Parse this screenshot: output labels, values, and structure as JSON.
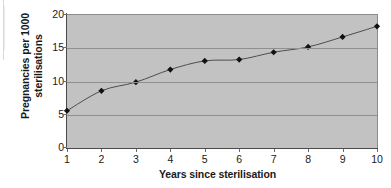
{
  "chart_data": {
    "type": "line",
    "title": "",
    "xlabel": "Years since sterilisation",
    "ylabel": "Pregnancies per 1000 sterilisations",
    "ylabel_lines": [
      "Pregnancies per 1000",
      "sterilisations"
    ],
    "x": [
      1,
      2,
      3,
      4,
      5,
      6,
      7,
      8,
      9,
      10
    ],
    "categories": [
      "1",
      "2",
      "3",
      "4",
      "5",
      "6",
      "7",
      "8",
      "9",
      "10"
    ],
    "values": [
      5.6,
      8.6,
      9.9,
      11.8,
      13.1,
      13.3,
      14.4,
      15.2,
      16.7,
      18.3
    ],
    "series": [
      {
        "name": "Cumulative pregnancy rate",
        "values": [
          5.6,
          8.6,
          9.9,
          11.8,
          13.1,
          13.3,
          14.4,
          15.2,
          16.7,
          18.3
        ]
      }
    ],
    "xlim": [
      1,
      10
    ],
    "ylim": [
      0,
      20
    ],
    "yticks": [
      0,
      5,
      10,
      15,
      20
    ],
    "ytick_labels": [
      "0",
      "5",
      "10",
      "15",
      "20"
    ],
    "xticks": [
      1,
      2,
      3,
      4,
      5,
      6,
      7,
      8,
      9,
      10
    ],
    "grid": "horizontal",
    "legend": "none",
    "marker": "diamond",
    "colors": {
      "plot_background": "#c2c2c2",
      "figure_background": "#ffffff",
      "gridline": "#8f8f8f",
      "axis": "#4a4a4a",
      "line": "#4d4d4d",
      "marker": "#111111",
      "text": "#1a1a1a"
    }
  }
}
